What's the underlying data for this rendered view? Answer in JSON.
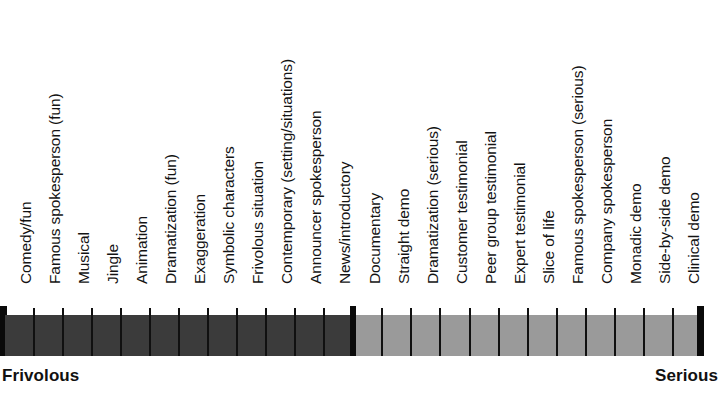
{
  "chart_data": {
    "type": "bar",
    "title": "",
    "subtitle": "",
    "xlabel": "",
    "ylabel": "",
    "orientation": "horizontal",
    "grid": false,
    "legend_position": "none",
    "axis_anchors": {
      "left": "Frivolous",
      "right": "Serious"
    },
    "groups": [
      {
        "name": "Frivolous",
        "color": "#3b3b3b",
        "count": 12,
        "categories": [
          "Comedy/fun",
          "Famous spokesperson (fun)",
          "Musical",
          "Jingle",
          "Animation",
          "Dramatization (fun)",
          "Exaggeration",
          "Symbolic characters",
          "Frivolous situation",
          "Contemporary (setting/situations)",
          "Announcer spokesperson",
          "News/introductory"
        ]
      },
      {
        "name": "Serious",
        "color": "#9a9a9a",
        "count": 12,
        "categories": [
          "Documentary",
          "Straight demo",
          "Dramatization (serious)",
          "Customer testimonial",
          "Peer group testimonial",
          "Expert testimonial",
          "Slice of life",
          "Famous spokesperson (serious)",
          "Company spokesperson",
          "Monadic demo",
          "Side-by-side demo",
          "Clinical demo"
        ]
      }
    ],
    "categories": [
      "Comedy/fun",
      "Famous spokesperson (fun)",
      "Musical",
      "Jingle",
      "Animation",
      "Dramatization (fun)",
      "Exaggeration",
      "Symbolic characters",
      "Frivolous situation",
      "Contemporary (setting/situations)",
      "Announcer spokesperson",
      "News/introductory",
      "Documentary",
      "Straight demo",
      "Dramatization (serious)",
      "Customer testimonial",
      "Peer group testimonial",
      "Expert testimonial",
      "Slice of life",
      "Famous spokesperson (serious)",
      "Company spokesperson",
      "Monadic demo",
      "Side-by-side demo",
      "Clinical demo"
    ],
    "values": [
      1,
      1,
      1,
      1,
      1,
      1,
      1,
      1,
      1,
      1,
      1,
      1,
      1,
      1,
      1,
      1,
      1,
      1,
      1,
      1,
      1,
      1,
      1,
      1
    ],
    "tones": [
      "frivolous",
      "frivolous",
      "frivolous",
      "frivolous",
      "frivolous",
      "frivolous",
      "frivolous",
      "frivolous",
      "frivolous",
      "frivolous",
      "frivolous",
      "frivolous",
      "serious",
      "serious",
      "serious",
      "serious",
      "serious",
      "serious",
      "serious",
      "serious",
      "serious",
      "serious",
      "serious",
      "serious"
    ]
  },
  "colors": {
    "frivolous": "#3b3b3b",
    "serious": "#9a9a9a",
    "tick": "#101010",
    "text": "#131313",
    "background": "#ffffff"
  },
  "anchors": {
    "left": "Frivolous",
    "right": "Serious"
  }
}
